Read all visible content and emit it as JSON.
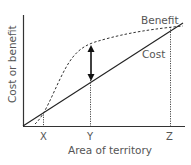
{
  "diagram": {
    "type": "cost-benefit-curve",
    "y_axis_label": "Cost or benefit",
    "x_axis_label": "Area of territory",
    "x_ticks": [
      "X",
      "Y",
      "Z"
    ],
    "curves": [
      {
        "name": "Benefit",
        "style": "dashed",
        "shape": "sigmoid"
      },
      {
        "name": "Cost",
        "style": "solid",
        "shape": "linear"
      }
    ],
    "annotation": "double-headed arrow at Y marking maximum net benefit",
    "labels": {
      "benefit": "Benefit",
      "cost": "Cost",
      "x": "X",
      "y": "Y",
      "z": "Z"
    }
  },
  "colors": {
    "axis": "#333333",
    "text": "#555555",
    "background": "#ffffff"
  }
}
